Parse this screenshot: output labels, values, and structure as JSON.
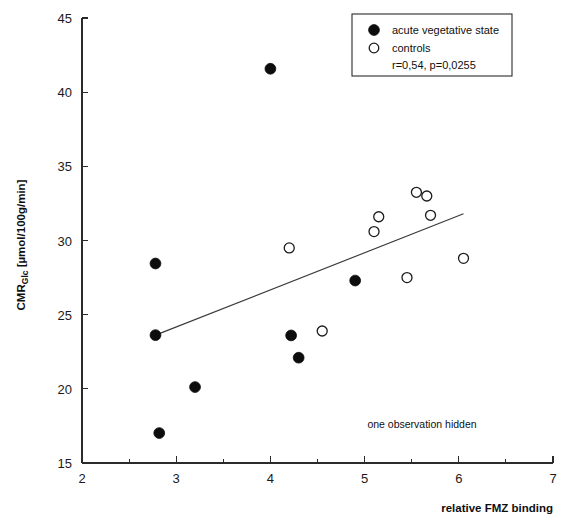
{
  "chart_data": {
    "type": "scatter",
    "title": "",
    "xlabel": "relative FMZ binding",
    "ylabel": "CMR_Glc [µmol/100g/min]",
    "ylabel_main": "CMR",
    "ylabel_sub": "Glc",
    "ylabel_units": " [µmol/100g/min]",
    "xlim": [
      2,
      7
    ],
    "ylim": [
      15,
      45
    ],
    "xticks": [
      2,
      3,
      4,
      5,
      6,
      7
    ],
    "xticklabels": [
      "2",
      "3",
      "4",
      "5",
      "6",
      "7"
    ],
    "xminorticks": [
      2.5,
      3.5,
      4.5,
      5.5,
      6.5
    ],
    "yticks": [
      15,
      20,
      25,
      30,
      35,
      40,
      45
    ],
    "yticklabels": [
      "15",
      "20",
      "25",
      "30",
      "35",
      "40",
      "45"
    ],
    "grid": false,
    "legend_position": "top-right",
    "series": [
      {
        "name": "acute vegetative state",
        "marker": "filled-circle",
        "color": "#0d0d0d",
        "points": [
          {
            "x": 2.78,
            "y": 28.45
          },
          {
            "x": 2.78,
            "y": 23.62
          },
          {
            "x": 2.82,
            "y": 17.02
          },
          {
            "x": 3.2,
            "y": 20.12
          },
          {
            "x": 4.0,
            "y": 41.58
          },
          {
            "x": 4.22,
            "y": 23.6
          },
          {
            "x": 4.3,
            "y": 22.1
          },
          {
            "x": 4.9,
            "y": 27.3
          }
        ]
      },
      {
        "name": "controls",
        "marker": "open-circle",
        "color": "#ffffff",
        "points": [
          {
            "x": 4.2,
            "y": 29.5
          },
          {
            "x": 4.55,
            "y": 23.9
          },
          {
            "x": 5.1,
            "y": 30.6
          },
          {
            "x": 5.15,
            "y": 31.6
          },
          {
            "x": 5.45,
            "y": 27.5
          },
          {
            "x": 5.55,
            "y": 33.25
          },
          {
            "x": 5.66,
            "y": 33.0
          },
          {
            "x": 5.7,
            "y": 31.7
          },
          {
            "x": 6.05,
            "y": 28.8
          }
        ]
      }
    ],
    "fit_line": {
      "x_start": 2.78,
      "y_start": 23.62,
      "x_end": 6.05,
      "y_end": 31.8
    },
    "statistics": "r=0,54, p=0,0255",
    "annotation": "one observation hidden"
  },
  "legend": {
    "entries": [
      {
        "label": "acute vegetative state",
        "marker": "filled-circle"
      },
      {
        "label": "controls",
        "marker": "open-circle"
      }
    ],
    "stats_label": "r=0,54, p=0,0255"
  }
}
